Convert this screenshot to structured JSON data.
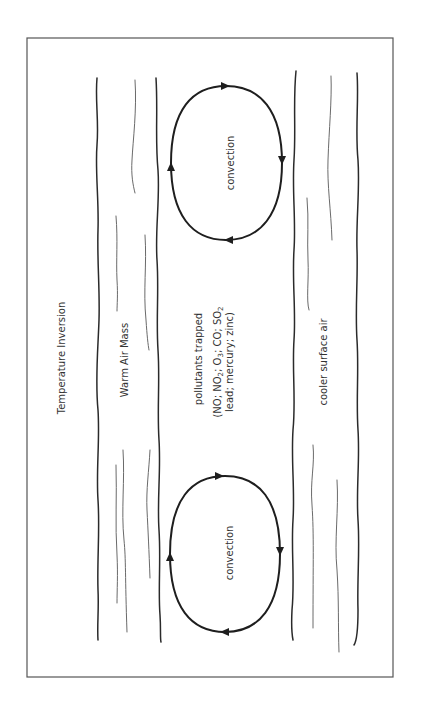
{
  "diagram": {
    "title": "Temperature Inversion",
    "layers": {
      "warm_air_mass": "Warm Air Mass",
      "trapped_zone": {
        "line1": "pollutants trapped",
        "line2_parts": [
          "(NO; NO",
          "2",
          "; O",
          "3",
          "; CO; SO",
          "2"
        ],
        "line3": "lead; mercury; zinc)"
      },
      "cooler_surface": "cooler surface air"
    },
    "convection_cells": [
      {
        "label": "convection",
        "direction": "clockwise"
      },
      {
        "label": "convection",
        "direction": "clockwise"
      }
    ],
    "orientation": "rotated 90deg counter-clockwise",
    "colors": {
      "line": "#1e1e1e",
      "frame": "#555555",
      "text": "#333333"
    }
  }
}
